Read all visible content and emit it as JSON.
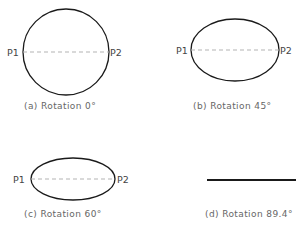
{
  "figure": {
    "panels": [
      {
        "id": "a",
        "caption": "(a) Rotation 0°",
        "rotation_deg": 0,
        "shape": "circle",
        "left_point": "P1",
        "right_point": "P2"
      },
      {
        "id": "b",
        "caption": "(b) Rotation 45°",
        "rotation_deg": 45,
        "shape": "ellipse",
        "left_point": "P1",
        "right_point": "P2"
      },
      {
        "id": "c",
        "caption": "(c) Rotation 60°",
        "rotation_deg": 60,
        "shape": "ellipse",
        "left_point": "P1",
        "right_point": "P2"
      },
      {
        "id": "d",
        "caption": "(d) Rotation 89.4°",
        "rotation_deg": 89.4,
        "shape": "line"
      }
    ],
    "colors": {
      "outline": "#1a1a1a",
      "dashed_axis": "#aaaaaa",
      "text": "#555555"
    }
  }
}
